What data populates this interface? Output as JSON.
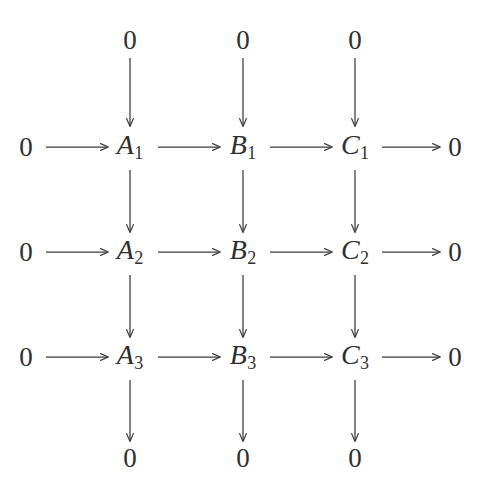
{
  "diagram": {
    "type": "commutative-diagram",
    "background_color": "#ffffff",
    "line_color": "#3a3a3a",
    "text_color": "#2f2f2f",
    "zero_label": "0",
    "columns": [
      {
        "key": "A",
        "x": 130
      },
      {
        "key": "B",
        "x": 243
      },
      {
        "key": "C",
        "x": 355
      }
    ],
    "left_zero_x": 26,
    "right_zero_x": 455,
    "rows": [
      {
        "key": "top-zeros",
        "y": 40
      },
      {
        "key": "row1",
        "y": 147
      },
      {
        "key": "row2",
        "y": 252
      },
      {
        "key": "row3",
        "y": 357
      },
      {
        "key": "bottom-zeros",
        "y": 458
      }
    ],
    "nodes": {
      "top_zeros": [
        {
          "label": "0",
          "x": 130,
          "y": 40
        },
        {
          "label": "0",
          "x": 243,
          "y": 40
        },
        {
          "label": "0",
          "x": 355,
          "y": 40
        }
      ],
      "bottom_zeros": [
        {
          "label": "0",
          "x": 130,
          "y": 458
        },
        {
          "label": "0",
          "x": 243,
          "y": 458
        },
        {
          "label": "0",
          "x": 355,
          "y": 458
        }
      ],
      "left_zeros": [
        {
          "label": "0",
          "x": 26,
          "y": 147
        },
        {
          "label": "0",
          "x": 26,
          "y": 252
        },
        {
          "label": "0",
          "x": 26,
          "y": 357
        }
      ],
      "right_zeros": [
        {
          "label": "0",
          "x": 455,
          "y": 147
        },
        {
          "label": "0",
          "x": 455,
          "y": 252
        },
        {
          "label": "0",
          "x": 455,
          "y": 357
        }
      ],
      "objects": [
        {
          "letter": "A",
          "subscript": "1",
          "x": 130,
          "y": 147
        },
        {
          "letter": "B",
          "subscript": "1",
          "x": 243,
          "y": 147
        },
        {
          "letter": "C",
          "subscript": "1",
          "x": 355,
          "y": 147
        },
        {
          "letter": "A",
          "subscript": "2",
          "x": 130,
          "y": 252
        },
        {
          "letter": "B",
          "subscript": "2",
          "x": 243,
          "y": 252
        },
        {
          "letter": "C",
          "subscript": "2",
          "x": 355,
          "y": 252
        },
        {
          "letter": "A",
          "subscript": "3",
          "x": 130,
          "y": 357
        },
        {
          "letter": "B",
          "subscript": "3",
          "x": 243,
          "y": 357
        },
        {
          "letter": "C",
          "subscript": "3",
          "x": 355,
          "y": 357
        }
      ]
    },
    "arrows": {
      "horizontal": [
        {
          "row": 1,
          "from": "0",
          "to": "A1",
          "x1": 46,
          "x2": 108,
          "y": 147
        },
        {
          "row": 1,
          "from": "A1",
          "to": "B1",
          "x1": 158,
          "x2": 220,
          "y": 147
        },
        {
          "row": 1,
          "from": "B1",
          "to": "C1",
          "x1": 270,
          "x2": 332,
          "y": 147
        },
        {
          "row": 1,
          "from": "C1",
          "to": "0",
          "x1": 382,
          "x2": 440,
          "y": 147
        },
        {
          "row": 2,
          "from": "0",
          "to": "A2",
          "x1": 46,
          "x2": 108,
          "y": 252
        },
        {
          "row": 2,
          "from": "A2",
          "to": "B2",
          "x1": 158,
          "x2": 220,
          "y": 252
        },
        {
          "row": 2,
          "from": "B2",
          "to": "C2",
          "x1": 270,
          "x2": 332,
          "y": 252
        },
        {
          "row": 2,
          "from": "C2",
          "to": "0",
          "x1": 382,
          "x2": 440,
          "y": 252
        },
        {
          "row": 3,
          "from": "0",
          "to": "A3",
          "x1": 46,
          "x2": 108,
          "y": 357
        },
        {
          "row": 3,
          "from": "A3",
          "to": "B3",
          "x1": 158,
          "x2": 220,
          "y": 357
        },
        {
          "row": 3,
          "from": "B3",
          "to": "C3",
          "x1": 270,
          "x2": 332,
          "y": 357
        },
        {
          "row": 3,
          "from": "C3",
          "to": "0",
          "x1": 382,
          "x2": 440,
          "y": 357
        }
      ],
      "vertical": [
        {
          "col": "A",
          "from": "0",
          "to": "A1",
          "x": 130,
          "y1": 58,
          "y2": 126
        },
        {
          "col": "B",
          "from": "0",
          "to": "B1",
          "x": 243,
          "y1": 58,
          "y2": 126
        },
        {
          "col": "C",
          "from": "0",
          "to": "C1",
          "x": 355,
          "y1": 58,
          "y2": 126
        },
        {
          "col": "A",
          "from": "A1",
          "to": "A2",
          "x": 130,
          "y1": 170,
          "y2": 232
        },
        {
          "col": "B",
          "from": "B1",
          "to": "B2",
          "x": 243,
          "y1": 170,
          "y2": 232
        },
        {
          "col": "C",
          "from": "C1",
          "to": "C2",
          "x": 355,
          "y1": 170,
          "y2": 232
        },
        {
          "col": "A",
          "from": "A2",
          "to": "A3",
          "x": 130,
          "y1": 275,
          "y2": 337
        },
        {
          "col": "B",
          "from": "B2",
          "to": "B3",
          "x": 243,
          "y1": 275,
          "y2": 337
        },
        {
          "col": "C",
          "from": "C2",
          "to": "C3",
          "x": 355,
          "y1": 275,
          "y2": 337
        },
        {
          "col": "A",
          "from": "A3",
          "to": "0",
          "x": 130,
          "y1": 380,
          "y2": 441
        },
        {
          "col": "B",
          "from": "B3",
          "to": "0",
          "x": 243,
          "y1": 380,
          "y2": 441
        },
        {
          "col": "C",
          "from": "C3",
          "to": "0",
          "x": 355,
          "y1": 380,
          "y2": 441
        }
      ]
    }
  }
}
